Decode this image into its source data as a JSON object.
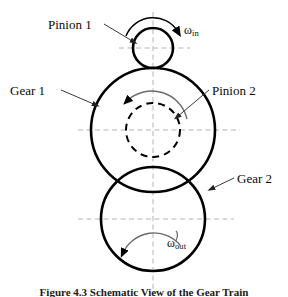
{
  "figure": {
    "caption": "Figure 4.3  Schematic View of the Gear Train",
    "background_color": "#ffffff",
    "stroke_color": "#000000",
    "centerline_color": "#b0b0b0",
    "leader_color": "#555555"
  },
  "labels": {
    "pinion_1": "Pinion 1",
    "gear_1": "Gear 1",
    "pinion_2": "Pinion 2",
    "gear_2": "Gear 2"
  },
  "omega": {
    "input_symbol": "ω",
    "input_subscript": "in",
    "output_symbol": "ω",
    "output_subscript": "out"
  },
  "diagram": {
    "type": "gear-train-schematic",
    "components": [
      {
        "name": "Pinion 1",
        "shape": "circle",
        "line_style": "solid",
        "center_x": 153,
        "center_y": 48,
        "radius": 20,
        "stroke_width": 2.6
      },
      {
        "name": "Gear 1",
        "shape": "circle",
        "line_style": "solid",
        "center_x": 153,
        "center_y": 130,
        "radius": 62,
        "stroke_width": 2.6
      },
      {
        "name": "Pinion 2",
        "shape": "circle",
        "line_style": "dashed",
        "center_x": 153,
        "center_y": 130,
        "radius": 27,
        "stroke_width": 2.0
      },
      {
        "name": "Gear 2",
        "shape": "circle",
        "line_style": "solid",
        "center_x": 153,
        "center_y": 219,
        "radius": 52,
        "stroke_width": 2.6
      }
    ],
    "rotation_arrows": [
      {
        "name": "omega-in-arc",
        "direction": "clockwise",
        "about": "Pinion 1"
      },
      {
        "name": "pinion-2-arc",
        "direction": "counter-clockwise",
        "about": "Pinion 2"
      },
      {
        "name": "omega-out-arc",
        "direction": "counter-clockwise",
        "about": "Gear 2"
      }
    ],
    "centerlines": {
      "vertical_x": 153,
      "horizontal_y": [
        48,
        130,
        219
      ]
    }
  }
}
